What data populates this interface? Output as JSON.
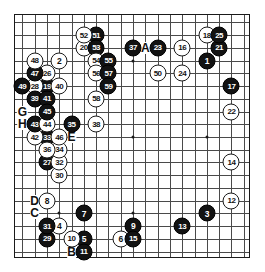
{
  "board": {
    "title": "Go game record diagram",
    "size": 19,
    "columns": 19,
    "rows": 19,
    "colors": {
      "black_stone": "#121212",
      "white_stone": "#ffffff",
      "line": "#4a4a4a",
      "border": "#1a1a1a",
      "background": "#ffffff"
    },
    "star_points": [
      {
        "c": 3,
        "r": 3
      },
      {
        "c": 9,
        "r": 3
      },
      {
        "c": 15,
        "r": 3
      },
      {
        "c": 3,
        "r": 9
      },
      {
        "c": 9,
        "r": 9
      },
      {
        "c": 15,
        "r": 9
      },
      {
        "c": 3,
        "r": 15
      },
      {
        "c": 9,
        "r": 15
      },
      {
        "c": 15,
        "r": 15
      }
    ]
  },
  "moves": [
    {
      "n": "1",
      "color": "black",
      "c": 15,
      "r": 3
    },
    {
      "n": "2",
      "color": "white",
      "c": 3,
      "r": 3
    },
    {
      "n": "3",
      "color": "black",
      "c": 15,
      "r": 15
    },
    {
      "n": "4",
      "color": "white",
      "c": 3,
      "r": 16
    },
    {
      "n": "5",
      "color": "black",
      "c": 5,
      "r": 17
    },
    {
      "n": "6",
      "color": "white",
      "c": 8,
      "r": 17
    },
    {
      "n": "7",
      "color": "black",
      "c": 5,
      "r": 15
    },
    {
      "n": "8",
      "color": "white",
      "c": 2,
      "r": 14
    },
    {
      "n": "9",
      "color": "black",
      "c": 9,
      "r": 16
    },
    {
      "n": "10",
      "color": "white",
      "c": 4,
      "r": 17
    },
    {
      "n": "11",
      "color": "black",
      "c": 5,
      "r": 18
    },
    {
      "n": "12",
      "color": "white",
      "c": 17,
      "r": 14
    },
    {
      "n": "13",
      "color": "black",
      "c": 13,
      "r": 16
    },
    {
      "n": "14",
      "color": "white",
      "c": 17,
      "r": 11
    },
    {
      "n": "15",
      "color": "black",
      "c": 9,
      "r": 17
    },
    {
      "n": "16",
      "color": "white",
      "c": 13,
      "r": 2
    },
    {
      "n": "17",
      "color": "black",
      "c": 17,
      "r": 5
    },
    {
      "n": "18",
      "color": "white",
      "c": 15,
      "r": 1
    },
    {
      "n": "19",
      "color": "black",
      "c": 2,
      "r": 5
    },
    {
      "n": "20",
      "color": "white",
      "c": 5,
      "r": 2
    },
    {
      "n": "21",
      "color": "black",
      "c": 16,
      "r": 2
    },
    {
      "n": "22",
      "color": "white",
      "c": 17,
      "r": 7
    },
    {
      "n": "23",
      "color": "black",
      "c": 11,
      "r": 2
    },
    {
      "n": "24",
      "color": "white",
      "c": 13,
      "r": 4
    },
    {
      "n": "25",
      "color": "black",
      "c": 16,
      "r": 1
    },
    {
      "n": "26",
      "color": "white",
      "c": 2,
      "r": 4
    },
    {
      "n": "27",
      "color": "black",
      "c": 2,
      "r": 11
    },
    {
      "n": "28",
      "color": "white",
      "c": 1,
      "r": 5
    },
    {
      "n": "29",
      "color": "black",
      "c": 2,
      "r": 17
    },
    {
      "n": "30",
      "color": "white",
      "c": 3,
      "r": 12
    },
    {
      "n": "31",
      "color": "black",
      "c": 2,
      "r": 16
    },
    {
      "n": "32",
      "color": "white",
      "c": 3,
      "r": 11
    },
    {
      "n": "33",
      "color": "black",
      "c": 2,
      "r": 9
    },
    {
      "n": "34",
      "color": "white",
      "c": 3,
      "r": 10
    },
    {
      "n": "35",
      "color": "black",
      "c": 4,
      "r": 8
    },
    {
      "n": "36",
      "color": "white",
      "c": 2,
      "r": 10
    },
    {
      "n": "37",
      "color": "black",
      "c": 9,
      "r": 2
    },
    {
      "n": "38",
      "color": "white",
      "c": 6,
      "r": 8
    },
    {
      "n": "39",
      "color": "black",
      "c": 1,
      "r": 6
    },
    {
      "n": "40",
      "color": "white",
      "c": 3,
      "r": 5
    },
    {
      "n": "41",
      "color": "black",
      "c": 2,
      "r": 6
    },
    {
      "n": "42",
      "color": "white",
      "c": 1,
      "r": 9
    },
    {
      "n": "43",
      "color": "black",
      "c": 1,
      "r": 8
    },
    {
      "n": "44",
      "color": "white",
      "c": 2,
      "r": 8
    },
    {
      "n": "45",
      "color": "black",
      "c": 2,
      "r": 7
    },
    {
      "n": "46",
      "color": "white",
      "c": 3,
      "r": 9
    },
    {
      "n": "47",
      "color": "black",
      "c": 1,
      "r": 4
    },
    {
      "n": "48",
      "color": "white",
      "c": 1,
      "r": 3
    },
    {
      "n": "49",
      "color": "black",
      "c": 0,
      "r": 5
    },
    {
      "n": "50",
      "color": "white",
      "c": 11,
      "r": 4
    },
    {
      "n": "51",
      "color": "black",
      "c": 6,
      "r": 1
    },
    {
      "n": "52",
      "color": "white",
      "c": 5,
      "r": 1
    },
    {
      "n": "53",
      "color": "black",
      "c": 6,
      "r": 2
    },
    {
      "n": "54",
      "color": "white",
      "c": 6,
      "r": 3
    },
    {
      "n": "55",
      "color": "black",
      "c": 7,
      "r": 3
    },
    {
      "n": "56",
      "color": "white",
      "c": 6,
      "r": 4
    },
    {
      "n": "57",
      "color": "black",
      "c": 7,
      "r": 4
    },
    {
      "n": "58",
      "color": "white",
      "c": 6,
      "r": 6
    },
    {
      "n": "59",
      "color": "black",
      "c": 7,
      "r": 5
    }
  ],
  "markers": [
    {
      "label": "A",
      "c": 10,
      "r": 2
    },
    {
      "label": "F",
      "c": 10,
      "r": 2,
      "offset_c": -0.9
    },
    {
      "label": "B",
      "c": 4,
      "r": 18
    },
    {
      "label": "C",
      "c": 1,
      "r": 15
    },
    {
      "label": "D",
      "c": 1,
      "r": 14
    },
    {
      "label": "E",
      "c": 4,
      "r": 9
    },
    {
      "label": "G",
      "c": 0,
      "r": 7
    },
    {
      "label": "H",
      "c": 0,
      "r": 8
    }
  ]
}
